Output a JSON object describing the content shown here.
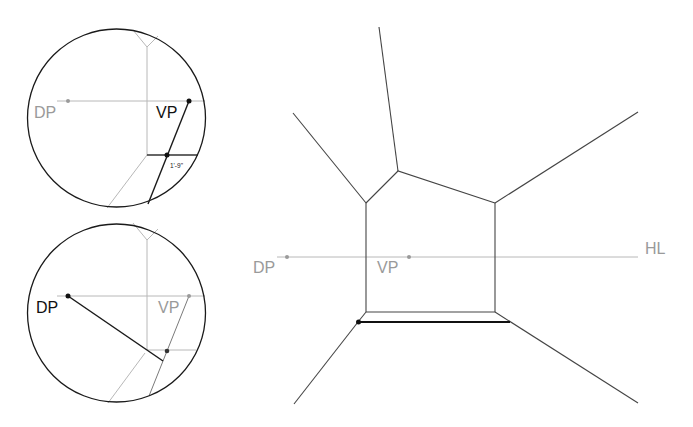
{
  "colors": {
    "background": "#ffffff",
    "dark_line": "#1a1a1a",
    "light_line": "#b3b3b3",
    "light_label": "#9a9a9a",
    "dark_label": "#111111"
  },
  "top_inset": {
    "labels": {
      "dp": "DP",
      "vp": "VP",
      "measure": "1'-9\""
    },
    "active_point": "VP"
  },
  "bottom_inset": {
    "labels": {
      "dp": "DP",
      "vp": "VP"
    },
    "active_point": "DP"
  },
  "main": {
    "labels": {
      "dp": "DP",
      "vp": "VP",
      "hl": "HL"
    }
  }
}
